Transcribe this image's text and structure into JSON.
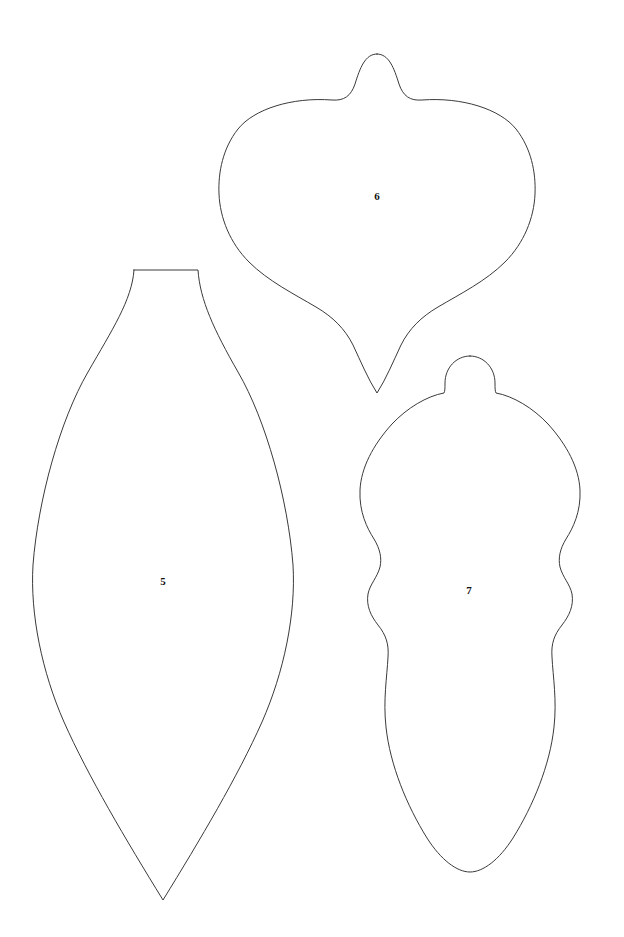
{
  "page": {
    "background_color": "#ffffff",
    "width": 624,
    "height": 937,
    "kind": "ornament-template-sheet"
  },
  "style": {
    "outline_color": "#3a3a3a",
    "fill_color": "#ffffff",
    "label_color": "#111111",
    "stroke_width": 1
  },
  "pieces": [
    {
      "id": "piece-5",
      "label": "5",
      "shape_name": "teardrop-leaf-ornament",
      "description": "Elongated teardrop / pointed-oval ornament with a flat trapezoidal neck at the top and a sharp point at the bottom.",
      "label_x": 163,
      "label_y": 582,
      "bounds": {
        "left": 32,
        "top": 269,
        "right": 295,
        "bottom": 901
      },
      "anchors": {
        "top_flat_left_x": 134,
        "top_flat_right_x": 198,
        "top_y": 270,
        "widest_left_x": 33,
        "widest_right_x": 294,
        "widest_y": 575,
        "bottom_point_x": 163,
        "bottom_point_y": 900
      }
    },
    {
      "id": "piece-6",
      "label": "6",
      "shape_name": "onion-bulb-ornament",
      "description": "Wide onion-shaped ornament with a small rounded nub finial on top and a narrow pointed drop at the bottom.",
      "label_x": 377,
      "label_y": 197,
      "bounds": {
        "left": 206,
        "top": 52,
        "right": 536,
        "bottom": 395
      },
      "anchors": {
        "nub_peak_x": 377,
        "nub_peak_y": 54,
        "shoulder_y": 100,
        "widest_left_x": 207,
        "widest_right_x": 535,
        "widest_y": 195,
        "bottom_tip_x": 377,
        "bottom_tip_y": 393
      }
    },
    {
      "id": "piece-7",
      "label": "7",
      "shape_name": "scalloped-finial-ornament",
      "description": "Tall finial ornament with a rounded dome cap, a bulbous upper body, two scalloped waist indentations on each side, and a pointed tip at the bottom.",
      "label_x": 469,
      "label_y": 591,
      "bounds": {
        "left": 359,
        "top": 355,
        "right": 581,
        "bottom": 874
      },
      "anchors": {
        "cap_left_x": 446,
        "cap_right_x": 495,
        "cap_peak_y": 356,
        "shoulder_y": 392,
        "widest_left_x": 360,
        "widest_right_x": 580,
        "widest_y": 490,
        "scallop_waist_y_1": 545,
        "scallop_waist_y_2": 615,
        "bottom_tip_x": 470,
        "bottom_tip_y": 872
      }
    }
  ],
  "paths": {
    "piece_5": "M 134 270 L 198 270 C 200 300 214 330 238 372 C 266 420 288 500 293 565 C 296 614 284 672 262 722 C 238 776 200 840 163 900 C 126 840 88 776 64 722 C 42 672 30 614 33 565 C 38 500 60 420 88 372 C 112 330 132 300 134 270 Z",
    "piece_6": "M 377 54 C 389 54 394 68 399 84 C 403 96 410 101 422 100 C 462 97 500 109 516 129 C 531 148 536 172 535 194 C 534 218 524 243 505 262 C 486 281 460 294 438 307 C 421 317 409 329 401 345 C 393 362 386 379 377 393 C 368 379 361 362 353 345 C 345 329 333 317 316 307 C 294 294 268 281 249 262 C 230 243 220 218 219 194 C 218 172 223 148 238 129 C 254 109 292 97 332 100 C 344 101 351 96 355 84 C 360 68 365 54 377 54 Z",
    "piece_7": "M 470 356 C 484 356 495 368 495 383 C 495 388 495 391 496 393 C 513 396 533 408 548 424 C 567 445 579 468 580 490 C 581 512 573 528 566 539 C 560 549 558 558 560 567 C 563 578 570 584 572 594 C 574 606 569 616 562 625 C 554 635 551 644 552 657 C 553 677 557 700 554 727 C 550 765 533 806 513 838 C 499 860 483 872 470 872 C 457 872 441 860 427 838 C 407 806 390 765 386 727 C 383 700 387 677 388 657 C 389 644 386 635 378 625 C 371 616 366 606 368 594 C 370 584 377 578 380 567 C 382 558 380 549 374 539 C 367 528 359 512 360 490 C 361 468 373 445 392 424 C 407 408 427 396 444 393 C 445 391 445 388 445 383 C 445 368 456 356 470 356 Z"
  }
}
